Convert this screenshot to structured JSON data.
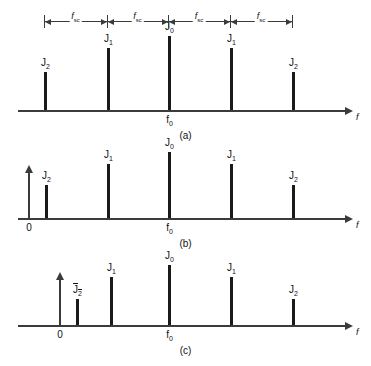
{
  "figure": {
    "axis_label": "f",
    "carrier_label": "f",
    "carrier_sub": "0",
    "origin_label": "0",
    "spacing_label": "f",
    "spacing_sub": "sc"
  },
  "dimension_bar": {
    "segments": [
      {
        "label": "f",
        "sub": "sc",
        "from": 44,
        "to": 107
      },
      {
        "label": "f",
        "sub": "sc",
        "from": 107,
        "to": 168
      },
      {
        "label": "f",
        "sub": "sc",
        "from": 168,
        "to": 230
      },
      {
        "label": "f",
        "sub": "sc",
        "from": 230,
        "to": 292
      }
    ]
  },
  "panels": [
    {
      "id": "a",
      "caption": "(a)",
      "baseline_y": 110,
      "has_origin_arrow": false,
      "origin_x": 28,
      "carrier_x": 168,
      "lines": [
        {
          "label": "J",
          "sub": "2",
          "overline": false,
          "x": 44,
          "height": 38
        },
        {
          "label": "J",
          "sub": "1",
          "overline": false,
          "x": 107,
          "height": 62
        },
        {
          "label": "J",
          "sub": "0",
          "overline": false,
          "x": 168,
          "height": 74
        },
        {
          "label": "J",
          "sub": "1",
          "overline": false,
          "x": 230,
          "height": 62
        },
        {
          "label": "J",
          "sub": "2",
          "overline": false,
          "x": 292,
          "height": 38
        }
      ]
    },
    {
      "id": "b",
      "caption": "(b)",
      "baseline_y": 78,
      "has_origin_arrow": true,
      "origin_x": 28,
      "carrier_x": 168,
      "lines": [
        {
          "label": "J",
          "sub": "2",
          "overline": false,
          "x": 45,
          "height": 33
        },
        {
          "label": "J",
          "sub": "1",
          "overline": false,
          "x": 107,
          "height": 54
        },
        {
          "label": "J",
          "sub": "0",
          "overline": false,
          "x": 168,
          "height": 66
        },
        {
          "label": "J",
          "sub": "1",
          "overline": false,
          "x": 230,
          "height": 54
        },
        {
          "label": "J",
          "sub": "2",
          "overline": false,
          "x": 292,
          "height": 33
        }
      ]
    },
    {
      "id": "c",
      "caption": "(c)",
      "baseline_y": 70,
      "has_origin_arrow": true,
      "origin_x": 59,
      "carrier_x": 168,
      "lines": [
        {
          "label": "J",
          "sub": "2",
          "overline": true,
          "x": 76,
          "height": 26
        },
        {
          "label": "J",
          "sub": "1",
          "overline": false,
          "x": 110,
          "height": 48
        },
        {
          "label": "J",
          "sub": "0",
          "overline": false,
          "x": 168,
          "height": 60
        },
        {
          "label": "J",
          "sub": "1",
          "overline": false,
          "x": 230,
          "height": 48
        },
        {
          "label": "J",
          "sub": "2",
          "overline": false,
          "x": 292,
          "height": 26
        }
      ]
    }
  ]
}
